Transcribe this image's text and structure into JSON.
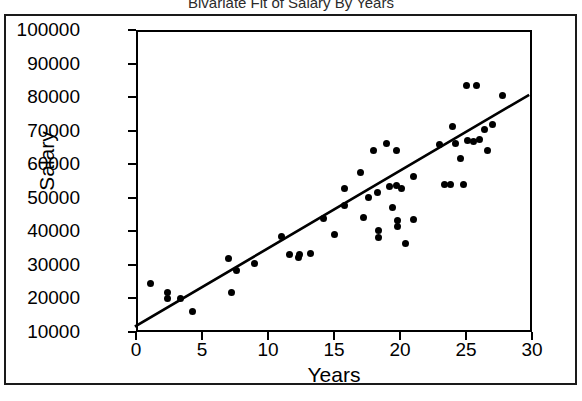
{
  "chart_data": {
    "type": "scatter",
    "title": "Bivariate Fit of Salary By Years",
    "xlabel": "Years",
    "ylabel": "Salary",
    "xlim": [
      0,
      30
    ],
    "ylim": [
      10000,
      100000
    ],
    "xticks": [
      0,
      5,
      10,
      15,
      20,
      25,
      30
    ],
    "yticks": [
      10000,
      20000,
      30000,
      40000,
      50000,
      60000,
      70000,
      80000,
      90000,
      100000
    ],
    "xtick_labels": [
      "0",
      "5",
      "10",
      "15",
      "20",
      "25",
      "30"
    ],
    "ytick_labels": [
      "10000",
      "20000",
      "30000",
      "40000",
      "50000",
      "60000",
      "70000",
      "80000",
      "90000",
      "100000"
    ],
    "grid": false,
    "legend": "none",
    "marker": "filled-circle",
    "marker_color": "#000000",
    "points": [
      {
        "x": 1.1,
        "y": 24600
      },
      {
        "x": 2.4,
        "y": 21900
      },
      {
        "x": 2.4,
        "y": 19900
      },
      {
        "x": 3.4,
        "y": 19900
      },
      {
        "x": 4.3,
        "y": 16000
      },
      {
        "x": 7.0,
        "y": 32000
      },
      {
        "x": 7.2,
        "y": 21900
      },
      {
        "x": 7.6,
        "y": 28400
      },
      {
        "x": 11.0,
        "y": 38500
      },
      {
        "x": 11.6,
        "y": 33100
      },
      {
        "x": 12.3,
        "y": 32200
      },
      {
        "x": 12.4,
        "y": 33100
      },
      {
        "x": 13.2,
        "y": 33400
      },
      {
        "x": 15.0,
        "y": 39200
      },
      {
        "x": 15.8,
        "y": 52900
      },
      {
        "x": 15.8,
        "y": 47800
      },
      {
        "x": 17.0,
        "y": 57600
      },
      {
        "x": 17.2,
        "y": 44200
      },
      {
        "x": 17.6,
        "y": 50100
      },
      {
        "x": 18.0,
        "y": 64000
      },
      {
        "x": 18.3,
        "y": 51600
      },
      {
        "x": 18.4,
        "y": 40200
      },
      {
        "x": 18.4,
        "y": 38300
      },
      {
        "x": 19.0,
        "y": 66100
      },
      {
        "x": 19.2,
        "y": 53400
      },
      {
        "x": 19.4,
        "y": 47000
      },
      {
        "x": 19.7,
        "y": 53800
      },
      {
        "x": 19.7,
        "y": 64100
      },
      {
        "x": 19.8,
        "y": 43200
      },
      {
        "x": 19.8,
        "y": 41400
      },
      {
        "x": 20.1,
        "y": 52900
      },
      {
        "x": 20.4,
        "y": 36300
      },
      {
        "x": 21.0,
        "y": 56400
      },
      {
        "x": 21.0,
        "y": 43600
      },
      {
        "x": 23.0,
        "y": 66000
      },
      {
        "x": 23.4,
        "y": 54100
      },
      {
        "x": 23.8,
        "y": 54100
      },
      {
        "x": 24.0,
        "y": 71200
      },
      {
        "x": 24.2,
        "y": 66200
      },
      {
        "x": 24.6,
        "y": 61800
      },
      {
        "x": 24.8,
        "y": 54100
      },
      {
        "x": 25.0,
        "y": 83400
      },
      {
        "x": 25.1,
        "y": 67200
      },
      {
        "x": 25.6,
        "y": 66800
      },
      {
        "x": 25.8,
        "y": 83500
      },
      {
        "x": 26.0,
        "y": 67300
      },
      {
        "x": 26.4,
        "y": 70400
      },
      {
        "x": 26.6,
        "y": 64200
      },
      {
        "x": 27.0,
        "y": 71900
      },
      {
        "x": 27.8,
        "y": 80600
      },
      {
        "x": 9.0,
        "y": 30500
      },
      {
        "x": 14.2,
        "y": 43800
      }
    ],
    "fit_line": {
      "label": "linear-fit",
      "x1": 0,
      "y1": 11800,
      "x2": 29.7,
      "y2": 80500,
      "color": "#000000"
    }
  }
}
